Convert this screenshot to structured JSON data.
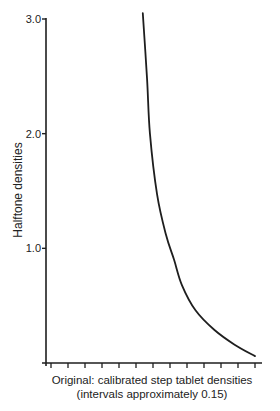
{
  "chart_data": {
    "type": "line",
    "title": "",
    "xlabel": "Original: calibrated step tablet densities",
    "xlabel_note": "(intervals approximately 0.15)",
    "ylabel": "Halftone densities",
    "x_ticks_count": 13,
    "x_tick_interval": 0.15,
    "xlim": [
      0,
      12
    ],
    "ylim": [
      0,
      3.0
    ],
    "y_ticks": [
      1.0,
      2.0,
      3.0
    ],
    "y_tick_labels": [
      "1.0",
      "2.0",
      "3.0"
    ],
    "grid": false,
    "legend": "none",
    "series": [
      {
        "name": "Halftone density curve",
        "x": [
          5.4,
          5.65,
          5.82,
          6.24,
          6.76,
          7.24,
          7.7,
          8.5,
          9.6,
          10.8,
          12.0
        ],
        "y": [
          3.05,
          2.48,
          2.0,
          1.47,
          1.12,
          0.9,
          0.68,
          0.46,
          0.29,
          0.16,
          0.06
        ]
      }
    ]
  }
}
